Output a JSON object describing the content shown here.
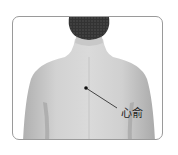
{
  "illustration": {
    "subject": "back view of human upper body",
    "acupoint": {
      "label": "心俞",
      "marker_color": "#111111",
      "leader_line_color": "#333333"
    },
    "colors": {
      "frame_border": "#9a9a9a",
      "skin": "#d0d0d0",
      "skin_shadow": "#b4b4b4",
      "hair": "#2e2e2e",
      "background": "#ffffff"
    }
  }
}
